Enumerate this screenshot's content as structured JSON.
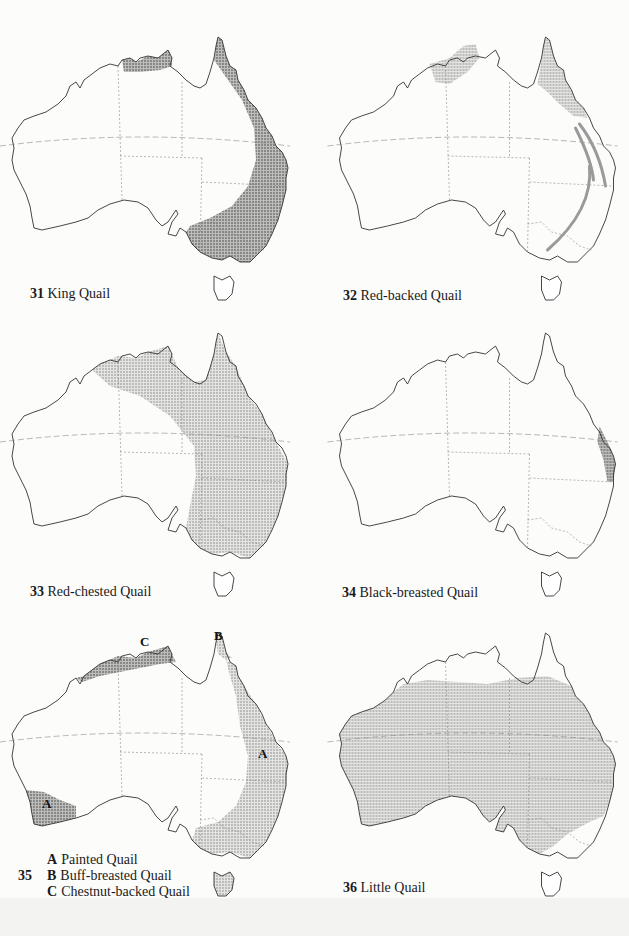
{
  "page": {
    "background": "#fcfcfb",
    "range_fill": "#cfcfcf",
    "outline_color": "#333333"
  },
  "maps": [
    {
      "id": 31,
      "number": "31",
      "name": "King Quail",
      "ranges": [
        "Top End of Northern Territory",
        "Eastern coastal arc from Cape York to south-eastern Australia"
      ]
    },
    {
      "id": 32,
      "number": "32",
      "name": "Red-backed Quail",
      "ranges": [
        "Kimberley/Top End north",
        "Cape York Peninsula"
      ],
      "annotations": [
        "migration arrows down eastern coast"
      ]
    },
    {
      "id": 33,
      "number": "33",
      "name": "Red-chested Quail",
      "ranges": [
        "Northern and eastern inland Australia"
      ]
    },
    {
      "id": 34,
      "number": "34",
      "name": "Black-breasted Quail",
      "ranges": [
        "Narrow strip on central east coast"
      ]
    },
    {
      "id": 35,
      "number": "35",
      "name": "",
      "legend": [
        {
          "letter": "A",
          "name": "Painted Quail"
        },
        {
          "letter": "B",
          "name": "Buff-breasted Quail"
        },
        {
          "letter": "C",
          "name": "Chestnut-backed Quail"
        }
      ],
      "map_labels": [
        "C",
        "B",
        "A",
        "A"
      ]
    },
    {
      "id": 36,
      "number": "36",
      "name": "Little Quail",
      "ranges": [
        "Most of mainland Australia except far north and south-east coast"
      ]
    }
  ]
}
